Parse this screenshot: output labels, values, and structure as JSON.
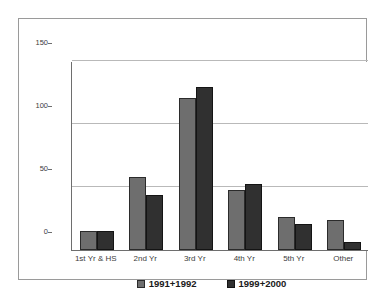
{
  "chart_data": {
    "type": "bar",
    "title": "",
    "subtitle": "",
    "xlabel": "",
    "ylabel": "",
    "categories": [
      "1st Yr & HS",
      "2nd Yr",
      "3rd Yr",
      "4th Yr",
      "5th Yr",
      "Other"
    ],
    "series": [
      {
        "name": "1991+1992",
        "color": "#6e6e6e",
        "values": [
          15,
          58,
          121,
          48,
          26,
          24
        ]
      },
      {
        "name": "1999+2000",
        "color": "#303030",
        "values": [
          15,
          44,
          129,
          52,
          21,
          6
        ]
      }
    ],
    "ylim": [
      0,
      150
    ],
    "yticks": [
      0,
      50,
      100,
      150
    ],
    "ytick_labels": [
      "0",
      "50",
      "100",
      "150"
    ],
    "grid": true,
    "grid_axis": "y",
    "legend_position": "bottom",
    "annotations": []
  },
  "colors": {
    "series_light": "#6e6e6e",
    "series_dark": "#303030",
    "gridline": "#b9b9b9",
    "axis": "#6e6e6e",
    "frame": "#9a9a9a",
    "background": "#ffffff",
    "tick_text": "#3c3c3c",
    "legend_text": "#1a1a1a"
  }
}
